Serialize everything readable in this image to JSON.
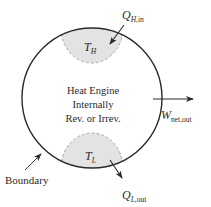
{
  "diagram": {
    "title": "Heat Engine",
    "center_text": {
      "line1": "Heat Engine",
      "line2": "Internally",
      "line3": "Rev. or Irrev."
    },
    "hot_reservoir": {
      "symbol": "T",
      "subscript": "H"
    },
    "cold_reservoir": {
      "symbol": "T",
      "subscript": "L"
    },
    "heat_in": {
      "symbol": "Q",
      "subscript_main": "H",
      "subscript_rest": ",in",
      "direction": "in"
    },
    "heat_out": {
      "symbol": "Q",
      "subscript_main": "L",
      "subscript_rest": ",out",
      "direction": "out"
    },
    "work_out": {
      "symbol": "W",
      "subscript": "net,out",
      "direction": "out"
    },
    "boundary_label": "Boundary",
    "colors": {
      "line": "#2a2a2a",
      "reservoir_fill": "#e3e3e3",
      "reservoir_dash": "#a8a8a8",
      "background": "#ffffff"
    }
  }
}
